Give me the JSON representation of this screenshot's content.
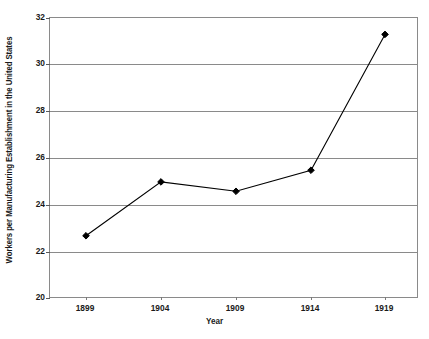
{
  "chart_data": {
    "type": "line",
    "title": "",
    "xlabel": "Year",
    "ylabel": "Workers per Manufacturing Establishment in the United States",
    "categories": [
      "1899",
      "1904",
      "1909",
      "1914",
      "1919"
    ],
    "x": [
      1899,
      1904,
      1909,
      1914,
      1919
    ],
    "values": [
      22.7,
      25.0,
      24.6,
      25.5,
      31.3
    ],
    "series": [
      {
        "name": "Workers per Manufacturing Establishment",
        "values": [
          22.7,
          25.0,
          24.6,
          25.5,
          31.3
        ]
      }
    ],
    "ylim": [
      20,
      32
    ],
    "yticks": [
      "20",
      "22",
      "24",
      "26",
      "28",
      "30",
      "32"
    ],
    "ytick_values": [
      20,
      22,
      24,
      26,
      28,
      30,
      32
    ],
    "grid": true,
    "legend": "none",
    "marker": "diamond",
    "line_color": "#000000",
    "marker_color": "#000000",
    "grid_color": "#8a8a8a",
    "background_color": "#ffffff"
  }
}
